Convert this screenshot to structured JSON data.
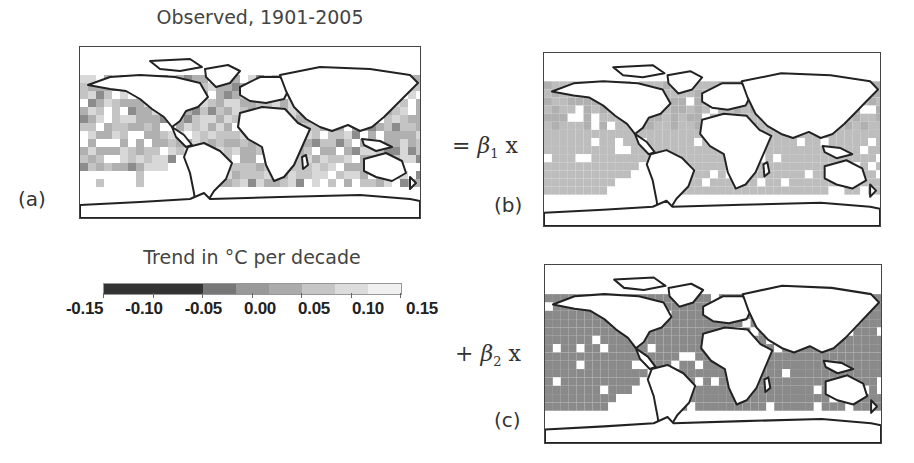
{
  "figure": {
    "title": "Observed, 1901-2005",
    "panels": [
      {
        "id": "a",
        "label": "(a)",
        "operator": "",
        "description": "Observed SST trend map"
      },
      {
        "id": "b",
        "label": "(b)",
        "operator": "= ",
        "beta": "β",
        "beta_sub": "1",
        "times": " x",
        "description": "Pattern 1 map (lighter grey ocean)"
      },
      {
        "id": "c",
        "label": "(c)",
        "operator": "+ ",
        "beta": "β",
        "beta_sub": "2",
        "times": " x",
        "description": "Pattern 2 map (darker grey ocean)"
      }
    ],
    "colorbar": {
      "title": "Trend in °C per decade",
      "tick_labels": [
        "-0.15",
        "-0.10",
        "-0.05",
        "0.00",
        "0.05",
        "0.10",
        "0.15"
      ],
      "range": [
        -0.15,
        0.15
      ],
      "segments": [
        {
          "from": -0.15,
          "to": -0.05,
          "color": "#333333"
        },
        {
          "from": -0.05,
          "to": -0.0167,
          "color": "#777777"
        },
        {
          "from": -0.0167,
          "to": 0.0167,
          "color": "#999999"
        },
        {
          "from": 0.0167,
          "to": 0.05,
          "color": "#ababab"
        },
        {
          "from": 0.05,
          "to": 0.0833,
          "color": "#c6c6c6"
        },
        {
          "from": 0.0833,
          "to": 0.1167,
          "color": "#dcdcdc"
        },
        {
          "from": 0.1167,
          "to": 0.15,
          "color": "#f0f0f0"
        }
      ]
    },
    "colors": {
      "coastline": "#222222",
      "frame": "#444444",
      "map_a_ocean": "#b8b8b8",
      "map_b_ocean": "#bdbdbd",
      "map_c_ocean": "#8a8a8a"
    }
  }
}
